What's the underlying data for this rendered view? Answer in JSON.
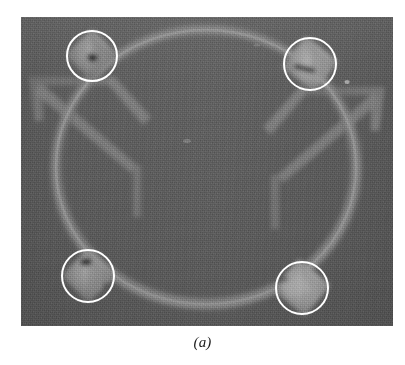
{
  "figure": {
    "caption": "(a)",
    "kind": "grayscale-micrograph",
    "alt_description": "Grayscale micrograph of a circular ring resonator structure on a substrate with four white annotation circles marking diamond-shaped anchor pads; two pads contain dark defect marks."
  },
  "photo": {
    "x": 21,
    "y": 17,
    "width": 372,
    "height": 309,
    "background_color": "#5c5c5c",
    "structure_color": "#7d7d7d",
    "structure_highlight_color": "#9a9a9a",
    "pad_color": "#8d8d8d",
    "pad_highlight_color": "#a6a6a6",
    "defect_color": "#2a2a2a"
  },
  "device": {
    "ring": {
      "label": "circular-ring-resonator",
      "center_x": 185,
      "center_y": 150,
      "radius_x": 150,
      "radius_y": 137,
      "stroke_width": 7
    },
    "support_tabs": [
      {
        "label": "left-support-tab",
        "side": "left"
      },
      {
        "label": "right-support-tab",
        "side": "right"
      }
    ],
    "anchor_pads": [
      {
        "label": "anchor-pad-top-left",
        "cx": 71,
        "cy": 38,
        "size": 37,
        "has_defect": true,
        "defect": "dark-void-spot"
      },
      {
        "label": "anchor-pad-top-right",
        "cx": 289,
        "cy": 47,
        "size": 40,
        "has_defect": true,
        "defect": "dark-crack-streak"
      },
      {
        "label": "anchor-pad-bottom-left",
        "cx": 67,
        "cy": 258,
        "size": 38,
        "has_defect": true,
        "defect": "dark-void-spot"
      },
      {
        "label": "anchor-pad-bottom-right",
        "cx": 281,
        "cy": 270,
        "size": 40,
        "has_defect": false,
        "defect": ""
      }
    ],
    "specks": [
      {
        "label": "bright-speck-center",
        "cx": 166,
        "cy": 124
      },
      {
        "label": "bright-speck-right",
        "cx": 326,
        "cy": 65
      },
      {
        "label": "bright-speck-upper",
        "cx": 236,
        "cy": 28
      }
    ]
  },
  "annotations": {
    "stroke_color": "#ffffff",
    "stroke_width": 2,
    "circles": [
      {
        "label": "annotation-circle-top-left",
        "cx": 92,
        "cy": 56,
        "r": 25
      },
      {
        "label": "annotation-circle-top-right",
        "cx": 310,
        "cy": 64,
        "r": 26
      },
      {
        "label": "annotation-circle-bottom-left",
        "cx": 88,
        "cy": 276,
        "r": 26
      },
      {
        "label": "annotation-circle-bottom-right",
        "cx": 302,
        "cy": 288,
        "r": 26
      }
    ]
  }
}
